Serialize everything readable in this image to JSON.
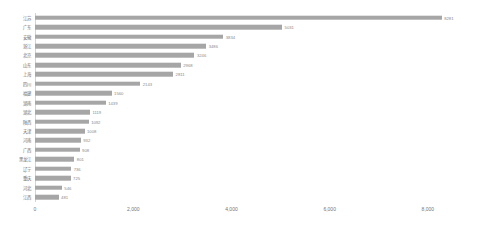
{
  "chart_data": {
    "type": "bar",
    "orientation": "horizontal",
    "title": "",
    "xlabel": "",
    "ylabel": "",
    "xlim": [
      0,
      9000
    ],
    "grid": false,
    "legend": null,
    "bar_color": "#a6a6a6",
    "axis_color": "#d4d4d4",
    "label_color": "#6e6e6e",
    "xticks": [
      {
        "value": 0,
        "label": "0"
      },
      {
        "value": 2000,
        "label": "2,000"
      },
      {
        "value": 4000,
        "label": "4,000"
      },
      {
        "value": 6000,
        "label": "6,000"
      },
      {
        "value": 8000,
        "label": "8,000"
      }
    ],
    "categories": [
      "江苏",
      "广东",
      "安徽",
      "浙江",
      "北京",
      "山东",
      "上海",
      "四川",
      "福建",
      "湖南",
      "湖北",
      "陕西",
      "天津",
      "河南",
      "广西",
      "黑龙江",
      "辽宁",
      "重庆",
      "河北",
      "江西"
    ],
    "values": [
      8281,
      5031,
      3834,
      3486,
      3246,
      2968,
      2811,
      2143,
      1560,
      1439,
      1119,
      1092,
      1008,
      932,
      908,
      801,
      736,
      725,
      546,
      481
    ],
    "value_labels": [
      "8281",
      "5031",
      "3834",
      "3486",
      "3246",
      "2968",
      "2811",
      "2143",
      "1560",
      "1439",
      "1119",
      "1092",
      "1008",
      "932",
      "908",
      "801",
      "736",
      "725",
      "546",
      "481"
    ]
  }
}
